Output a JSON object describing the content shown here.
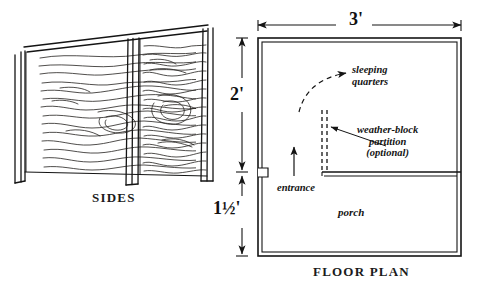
{
  "drawing": {
    "title_sides": "SIDES",
    "title_floor_plan": "FLOOR PLAN",
    "line_color": "#1a1a1a",
    "background_color": "#ffffff"
  },
  "dimensions": {
    "width": "3'",
    "height": "2'",
    "porch_depth": "1½'"
  },
  "annotations": {
    "sleeping_quarters_line1": "sleeping",
    "sleeping_quarters_line2": "quarters",
    "weather_block_line1": "weather-block",
    "weather_block_line2": "partition",
    "weather_block_line3": "(optional)",
    "entrance": "entrance",
    "porch": "porch"
  }
}
